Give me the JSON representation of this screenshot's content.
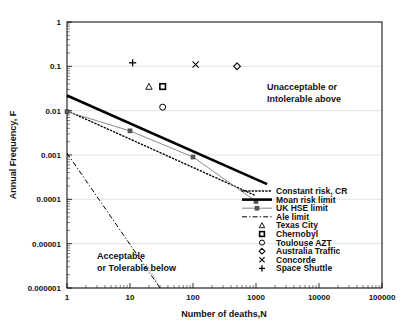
{
  "chart_data": {
    "type": "line",
    "title": "",
    "xlabel": "Number of deaths,N",
    "ylabel": "Annual Frequency, F",
    "xscale": "log",
    "yscale": "log",
    "xlim": [
      1,
      100000
    ],
    "ylim": [
      1e-06,
      1
    ],
    "xticks": [
      1,
      10,
      100,
      1000,
      10000,
      100000
    ],
    "xtick_labels": [
      "1",
      "10",
      "100",
      "1000",
      "10000",
      "100000"
    ],
    "yticks": [
      1,
      0.1,
      0.01,
      0.001,
      0.0001,
      1e-05,
      1e-06
    ],
    "ytick_labels": [
      "1",
      "0.1",
      "0.01",
      "0.001",
      "0.0001",
      "0.00001",
      "0.000001"
    ],
    "grid": true,
    "legend_position": "center-right",
    "annotations": [
      {
        "name": "unacceptable-region-label",
        "lines": [
          "Unacceptable or",
          "Intolerable above"
        ],
        "x": 1500,
        "y": 0.03
      },
      {
        "name": "acceptable-region-label",
        "lines": [
          "Acceptable",
          "or Tolerable below"
        ],
        "x": 3,
        "y": 4.5e-06
      }
    ],
    "series": [
      {
        "name": "Constant risk, CR",
        "style": "dotted",
        "color": "#000000",
        "marker": "none",
        "points": [
          [
            1,
            0.01
          ],
          [
            1000,
            0.00012
          ]
        ]
      },
      {
        "name": "Moan risk limit",
        "style": "solid-thick",
        "color": "#000000",
        "marker": "none",
        "points": [
          [
            1,
            0.022
          ],
          [
            1500,
            0.00022
          ]
        ]
      },
      {
        "name": "UK HSE limit",
        "style": "solid-thin-marker",
        "color": "#808080",
        "marker": "square-small",
        "points": [
          [
            1,
            0.0095
          ],
          [
            10,
            0.0035
          ],
          [
            100,
            0.0009
          ],
          [
            1000,
            9e-05
          ]
        ]
      },
      {
        "name": "Ale limit",
        "style": "dash-dot",
        "color": "#000000",
        "marker": "none",
        "points": [
          [
            1,
            0.0011
          ],
          [
            30,
            1e-06
          ]
        ]
      }
    ],
    "scatter_points": [
      {
        "name": "Texas City",
        "marker": "triangle",
        "x": 20,
        "y": 0.035
      },
      {
        "name": "Chernobyl",
        "marker": "square",
        "x": 33,
        "y": 0.035
      },
      {
        "name": "Toulouse AZT",
        "marker": "circle",
        "x": 33,
        "y": 0.012
      },
      {
        "name": "Australia Traffic",
        "marker": "diamond",
        "x": 500,
        "y": 0.1
      },
      {
        "name": "Concorde",
        "marker": "cross-x",
        "x": 110,
        "y": 0.11
      },
      {
        "name": "Space Shuttle",
        "marker": "plus",
        "x": 11,
        "y": 0.12
      }
    ],
    "legend_entries": [
      {
        "label": "Constant risk, CR",
        "kind": "line",
        "style": "dotted"
      },
      {
        "label": "Moan risk limit",
        "kind": "line",
        "style": "solid-thick"
      },
      {
        "label": "UK HSE limit",
        "kind": "line",
        "style": "solid-thin-marker"
      },
      {
        "label": "Ale limit",
        "kind": "line",
        "style": "dash-dot"
      },
      {
        "label": "Texas City",
        "kind": "marker",
        "style": "triangle"
      },
      {
        "label": "Chernobyl",
        "kind": "marker",
        "style": "square"
      },
      {
        "label": "Toulouse AZT",
        "kind": "marker",
        "style": "circle"
      },
      {
        "label": "Australia Traffic",
        "kind": "marker",
        "style": "diamond"
      },
      {
        "label": "Concorde",
        "kind": "marker",
        "style": "cross-x"
      },
      {
        "label": "Space Shuttle",
        "kind": "marker",
        "style": "plus"
      }
    ]
  }
}
